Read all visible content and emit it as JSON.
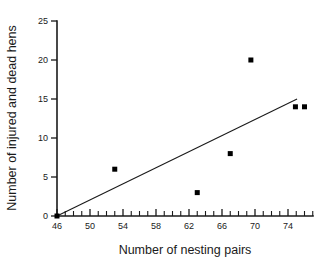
{
  "chart_data": {
    "type": "scatter",
    "title": "",
    "xlabel": "Number of nesting pairs",
    "ylabel": "Number of injured and dead hens",
    "xlim": [
      45,
      77
    ],
    "ylim": [
      0,
      25
    ],
    "xticks": [
      46,
      50,
      54,
      58,
      62,
      66,
      70,
      74
    ],
    "yticks": [
      0,
      5,
      10,
      15,
      20,
      25
    ],
    "xtick_labels": [
      "46",
      "50",
      "54",
      "58",
      "62",
      "66",
      "70",
      "74"
    ],
    "ytick_labels": [
      "0",
      "5",
      "10",
      "15",
      "20",
      "25"
    ],
    "x_minor_tick_step": 1,
    "grid": false,
    "legend": null,
    "points": [
      {
        "x": 46.0,
        "y": 0
      },
      {
        "x": 53.0,
        "y": 6
      },
      {
        "x": 63.0,
        "y": 3
      },
      {
        "x": 67.0,
        "y": 8
      },
      {
        "x": 69.5,
        "y": 20
      },
      {
        "x": 74.9,
        "y": 14
      },
      {
        "x": 76.0,
        "y": 14
      }
    ],
    "series": [
      {
        "name": "injured and dead hens",
        "x": [
          46.0,
          53.0,
          63.0,
          67.0,
          69.5,
          74.9,
          76.0
        ],
        "values": [
          0,
          6,
          3,
          8,
          20,
          14,
          14
        ]
      }
    ],
    "trend_line": {
      "type": "linear-fit",
      "x_start": 46.0,
      "y_start": 0.0,
      "x_end": 75.1,
      "y_end": 15.0
    },
    "marker": {
      "shape": "square",
      "color": "#000000",
      "size_px": 5
    },
    "colors": {
      "axis": "#1a1a1a",
      "marker": "#000000",
      "trend": "#1a1a1a",
      "background": "#ffffff"
    }
  },
  "axes": {
    "x_title": "Number of nesting pairs",
    "y_title": "Number of injured and dead hens"
  }
}
